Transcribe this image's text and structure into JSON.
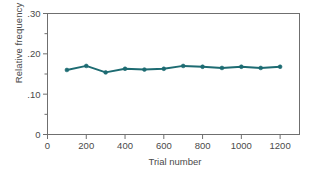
{
  "chart_data": {
    "type": "line",
    "title": "",
    "subtitle": "",
    "xlabel": "Trial number",
    "ylabel": "Relative frequency",
    "x": [
      100,
      200,
      300,
      400,
      500,
      600,
      700,
      800,
      900,
      1000,
      1100,
      1200
    ],
    "values": [
      0.16,
      0.17,
      0.154,
      0.163,
      0.161,
      0.163,
      0.17,
      0.168,
      0.165,
      0.168,
      0.165,
      0.168
    ],
    "series": [
      {
        "name": "Relative frequency",
        "values": [
          0.16,
          0.17,
          0.154,
          0.163,
          0.161,
          0.163,
          0.17,
          0.168,
          0.165,
          0.168,
          0.165,
          0.168
        ]
      }
    ],
    "xlim": [
      0,
      1300
    ],
    "ylim": [
      0,
      0.3
    ],
    "x_ticks": [
      0,
      200,
      400,
      600,
      800,
      1000,
      1200
    ],
    "x_tick_labels": [
      "0",
      "200",
      "400",
      "600",
      "800",
      "1000",
      "1200"
    ],
    "y_ticks": [
      0,
      0.1,
      0.2,
      0.3
    ],
    "y_tick_labels": [
      "0",
      ".10",
      ".20",
      ".30"
    ],
    "y_minor_ticks": [
      0.05,
      0.15,
      0.25
    ],
    "grid": false,
    "legend": false,
    "legend_position": "none",
    "marker": "circle",
    "line_color": "#1d6b72",
    "marker_color": "#1d6b72",
    "axis_color": "#6f6f6f",
    "text_color": "#4a4a4a",
    "background": "#ffffff"
  }
}
